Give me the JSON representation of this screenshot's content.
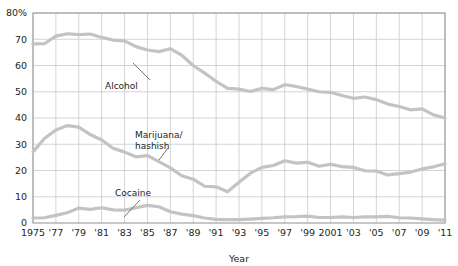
{
  "chart_data": {
    "type": "line",
    "title": "",
    "xlabel": "Year",
    "ylabel": "",
    "xlim": [
      1975,
      2011
    ],
    "ylim": [
      0,
      80
    ],
    "grid": true,
    "legend_position": "inline-annotations",
    "y_ticks": [
      0,
      10,
      20,
      30,
      40,
      50,
      60,
      70,
      80
    ],
    "y_tick_labels": [
      "0",
      "10",
      "20",
      "30",
      "40",
      "50",
      "60",
      "70",
      "80%"
    ],
    "x_ticks": [
      1975,
      1977,
      1979,
      1981,
      1983,
      1985,
      1987,
      1989,
      1991,
      1993,
      1995,
      1997,
      1999,
      2001,
      2003,
      2005,
      2007,
      2009,
      2011
    ],
    "x_tick_labels": [
      "1975",
      "'77",
      "'79",
      "'81",
      "'83",
      "'85",
      "'87",
      "'89",
      "'91",
      "'93",
      "'95",
      "'97",
      "'99",
      "2001",
      "'03",
      "'05",
      "'07",
      "'09",
      "'11"
    ],
    "x": [
      1975,
      1976,
      1977,
      1978,
      1979,
      1980,
      1981,
      1982,
      1983,
      1984,
      1985,
      1986,
      1987,
      1988,
      1989,
      1990,
      1991,
      1992,
      1993,
      1994,
      1995,
      1996,
      1997,
      1998,
      1999,
      2000,
      2001,
      2002,
      2003,
      2004,
      2005,
      2006,
      2007,
      2008,
      2009,
      2010,
      2011
    ],
    "series": [
      {
        "name": "Alcohol",
        "color": "#c3c3c3",
        "values": [
          68.2,
          68.3,
          71.2,
          72.1,
          71.8,
          72.0,
          70.7,
          69.7,
          69.4,
          67.2,
          65.9,
          65.3,
          66.4,
          63.9,
          60.0,
          57.1,
          54.0,
          51.3,
          51.0,
          50.1,
          51.3,
          50.8,
          52.7,
          52.0,
          51.0,
          50.0,
          49.8,
          48.6,
          47.5,
          48.0,
          47.0,
          45.3,
          44.4,
          43.1,
          43.5,
          41.2,
          40.0
        ]
      },
      {
        "name": "Marijuana/hashish",
        "color": "#c3c3c3",
        "values": [
          27.1,
          32.2,
          35.4,
          37.1,
          36.5,
          33.7,
          31.6,
          28.5,
          27.0,
          25.2,
          25.7,
          23.4,
          21.0,
          18.0,
          16.7,
          14.0,
          13.8,
          11.9,
          15.5,
          19.0,
          21.2,
          21.9,
          23.7,
          22.8,
          23.1,
          21.6,
          22.4,
          21.5,
          21.2,
          19.9,
          19.8,
          18.3,
          18.8,
          19.4,
          20.6,
          21.4,
          22.6
        ]
      },
      {
        "name": "Cocaine",
        "color": "#c3c3c3",
        "values": [
          1.9,
          2.0,
          2.9,
          3.9,
          5.7,
          5.2,
          5.8,
          5.0,
          4.9,
          5.8,
          6.7,
          6.2,
          4.3,
          3.4,
          2.8,
          1.9,
          1.4,
          1.3,
          1.3,
          1.5,
          1.8,
          2.0,
          2.3,
          2.4,
          2.6,
          2.1,
          2.1,
          2.3,
          2.1,
          2.3,
          2.3,
          2.5,
          2.0,
          1.9,
          1.6,
          1.3,
          1.1
        ]
      }
    ],
    "annotations": [
      {
        "label": "Alcohol",
        "x_px": 105,
        "y_px": 89,
        "leader": {
          "x1": 150,
          "y1": 80,
          "x2": 133,
          "y2": 63
        }
      },
      {
        "label": "Marijuana/",
        "x_px": 135,
        "y_px": 138,
        "leader": {
          "x1": 159,
          "y1": 160,
          "x2": 168,
          "y2": 148
        }
      },
      {
        "label": "hashish",
        "x_px": 135,
        "y_px": 149,
        "leader": null
      },
      {
        "label": "Cocaine",
        "x_px": 115,
        "y_px": 196,
        "leader": {
          "x1": 124,
          "y1": 217,
          "x2": 140,
          "y2": 200
        }
      }
    ],
    "colors": {
      "line": "#c3c3c3",
      "grid": "#c9c9c9",
      "frame": "#9a9a9a",
      "text": "#231f20",
      "background": "#ffffff"
    }
  }
}
